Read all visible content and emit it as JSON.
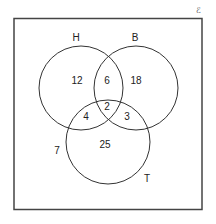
{
  "diagram": {
    "type": "venn",
    "universal_label": "ℰ",
    "sets": [
      {
        "name": "H",
        "cx": 81,
        "cy": 88,
        "r": 42,
        "label_x": 76,
        "label_y": 38
      },
      {
        "name": "B",
        "cx": 136,
        "cy": 88,
        "r": 42,
        "label_x": 135,
        "label_y": 38
      },
      {
        "name": "T",
        "cx": 108,
        "cy": 142,
        "r": 42,
        "label_x": 147,
        "label_y": 179
      }
    ],
    "regions": [
      {
        "id": "H_only",
        "value": "12",
        "x": 77,
        "y": 81
      },
      {
        "id": "H_B_only",
        "value": "6",
        "x": 107,
        "y": 81
      },
      {
        "id": "B_only",
        "value": "18",
        "x": 136,
        "y": 81
      },
      {
        "id": "H_B_T",
        "value": "2",
        "x": 107,
        "y": 107
      },
      {
        "id": "H_T_only",
        "value": "4",
        "x": 86,
        "y": 117
      },
      {
        "id": "B_T_only",
        "value": "3",
        "x": 127,
        "y": 117
      },
      {
        "id": "T_only",
        "value": "25",
        "x": 105,
        "y": 145
      },
      {
        "id": "outside",
        "value": "7",
        "x": 57,
        "y": 151
      }
    ],
    "frame": {
      "x": 13,
      "y": 18,
      "width": 189,
      "height": 192
    }
  }
}
